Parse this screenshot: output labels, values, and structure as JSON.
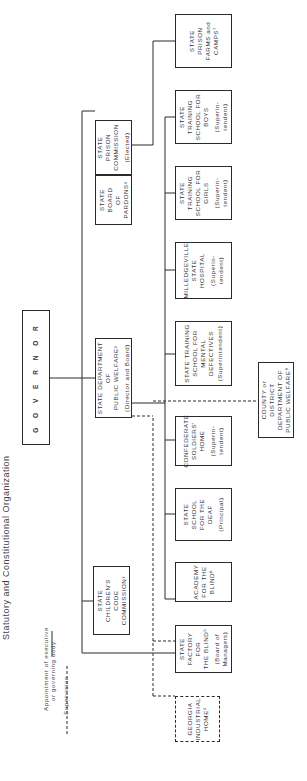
{
  "title": "Statutory and Constitutional Organization",
  "legend": {
    "appointment_line1": "Appointment of executive",
    "appointment_line2": "or governing body",
    "supervision": "Supervision"
  },
  "governor": {
    "label": "G O V E R N O R"
  },
  "middle_tier": {
    "board_of_pardons": {
      "name": "STATE BOARD\nOF PARDONS³"
    },
    "prison_commission": {
      "name": "STATE PRISON\nCOMMISSION",
      "note": "(Elected)"
    },
    "public_welfare": {
      "name": "STATE DEPARTMENT OF\nPUBLIC WELFARE²",
      "note": "(Director and Board)"
    },
    "childrens_code": {
      "name": "STATE CHILDREN'S\nCODE COMMISSION¹"
    }
  },
  "institutions": [
    {
      "name": "STATE PRISON\nFARMS and\nCAMPS⁷",
      "note": ""
    },
    {
      "name": "STATE TRAINING\nSCHOOL FOR\nBOYS",
      "note": "(Superin-\ntendent)"
    },
    {
      "name": "STATE TRAINING\nSCHOOL FOR\nGIRLS",
      "note": "(Superin-\ntendent)"
    },
    {
      "name": "MILLEDGEVILLE\nSTATE HOSPITAL",
      "note": "(Superin-\ntendent)"
    },
    {
      "name": "STATE TRAINING\nSCHOOL FOR\nMENTAL\nDEFECTIVES",
      "note": "(Superintendent)"
    },
    {
      "name": "CONFEDERATE\nSOLDIERS'\nHOME",
      "note": "(Superin-\ntendent)"
    },
    {
      "name": "STATE SCHOOL\nFOR THE DEAF",
      "note": "(Principal)"
    },
    {
      "name": "ACADEMY\nFOR THE\nBLIND⁶",
      "note": ""
    },
    {
      "name": "STATE\nFACTORY FOR\nTHE BLIND⁵",
      "note": "(Board of\nManagers)"
    },
    {
      "name": "GEORGIA\nINDUSTRIAL\nHOME⁴",
      "note": ""
    }
  ],
  "county": {
    "name": "COUNTY or DISTRICT\nDEPARTMENT OF\nPUBLIC WELFARE⁸"
  },
  "colors": {
    "line": "#2a2a2a",
    "text": "#333333",
    "background": "#ffffff"
  }
}
